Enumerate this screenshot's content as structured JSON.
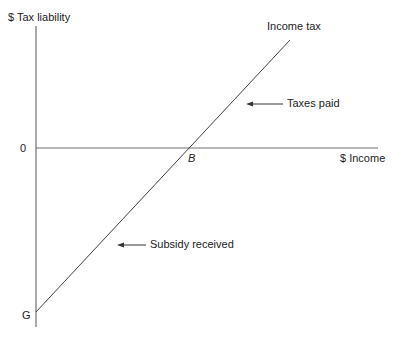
{
  "diagram": {
    "type": "income-tax-liability-line",
    "y_axis_label": "$ Tax liability",
    "x_axis_label": "$ Income",
    "origin_label": "0",
    "intercept_label": "G",
    "breakeven_label": "B",
    "line_label": "Income tax",
    "annotations": {
      "above": "Taxes paid",
      "below": "Subsidy received"
    },
    "colors": {
      "axis": "#707070",
      "line": "#404040",
      "text": "#222222"
    }
  }
}
